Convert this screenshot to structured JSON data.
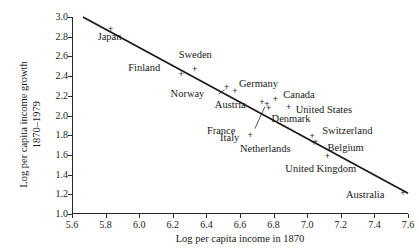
{
  "chart_data": {
    "type": "scatter",
    "title": "",
    "xlabel": "Log per capita income in 1870",
    "ylabel": "Log per capita income growth\n1870–1979",
    "xlim": [
      5.6,
      7.6
    ],
    "ylim": [
      1.0,
      3.0
    ],
    "xticks": [
      "5.6",
      "5.8",
      "6.0",
      "6.2",
      "6.4",
      "6.6",
      "6.8",
      "7.0",
      "7.2",
      "7.4",
      "7.6"
    ],
    "yticks": [
      "1.0",
      "1.2",
      "1.4",
      "1.6",
      "1.8",
      "2.0",
      "2.2",
      "2.4",
      "2.6",
      "2.8",
      "3.0"
    ],
    "grid": false,
    "legend": false,
    "marker": "+",
    "marker_color": "#2a2a2a",
    "line_color": "#1a1a1a",
    "points": [
      {
        "label": "Japan",
        "x": 5.83,
        "y": 2.87,
        "label_dx": -13,
        "label_dy": 9,
        "leader": false
      },
      {
        "label": "Sweden",
        "x": 6.33,
        "y": 2.47,
        "label_dx": -16,
        "label_dy": -12,
        "leader": false
      },
      {
        "label": "Finland",
        "x": 6.25,
        "y": 2.42,
        "label_dx": -53,
        "label_dy": -4,
        "leader": false
      },
      {
        "label": "Norway",
        "x": 6.52,
        "y": 2.28,
        "label_dx": -56,
        "label_dy": 8,
        "leader": true,
        "leader_to_dx": -8,
        "leader_to_dy": 6
      },
      {
        "label": "Germany",
        "x": 6.57,
        "y": 2.24,
        "label_dx": 4,
        "label_dy": -6,
        "leader": false
      },
      {
        "label": "Canada",
        "x": 6.81,
        "y": 2.16,
        "label_dx": 8,
        "label_dy": -3,
        "leader": false
      },
      {
        "label": "Austria",
        "x": 6.73,
        "y": 2.13,
        "label_dx": -47,
        "label_dy": 4,
        "leader": false
      },
      {
        "label": "United States",
        "x": 6.89,
        "y": 2.08,
        "label_dx": 7,
        "label_dy": 4,
        "leader": false
      },
      {
        "label": "Denmark",
        "x": 6.77,
        "y": 2.07,
        "label_dx": 3,
        "label_dy": 12,
        "leader": false
      },
      {
        "label": "France",
        "x": 6.76,
        "y": 2.11,
        "label_dx": -60,
        "label_dy": 28,
        "leader": true,
        "leader_to_dx": -12,
        "leader_to_dy": 24
      },
      {
        "label": "Italy",
        "x": 6.66,
        "y": 1.8,
        "label_dx": -30,
        "label_dy": 5,
        "leader": false
      },
      {
        "label": "Switzerland",
        "x": 7.03,
        "y": 1.79,
        "label_dx": 10,
        "label_dy": -3,
        "leader": false
      },
      {
        "label": "Belgium",
        "x": 7.05,
        "y": 1.73,
        "label_dx": 12,
        "label_dy": 8,
        "leader": false
      },
      {
        "label": "Netherlands",
        "x": 7.04,
        "y": 1.72,
        "label_dx": -74,
        "label_dy": 8,
        "leader": false
      },
      {
        "label": "United Kingdom",
        "x": 7.12,
        "y": 1.58,
        "label_dx": -42,
        "label_dy": 14,
        "leader": false
      },
      {
        "label": "Australia",
        "x": 7.57,
        "y": 1.21,
        "label_dx": -57,
        "label_dy": 4,
        "leader": false
      }
    ],
    "fit_line": {
      "x0": 5.665,
      "y0": 3.0,
      "x1": 7.6,
      "y1": 1.21
    }
  }
}
